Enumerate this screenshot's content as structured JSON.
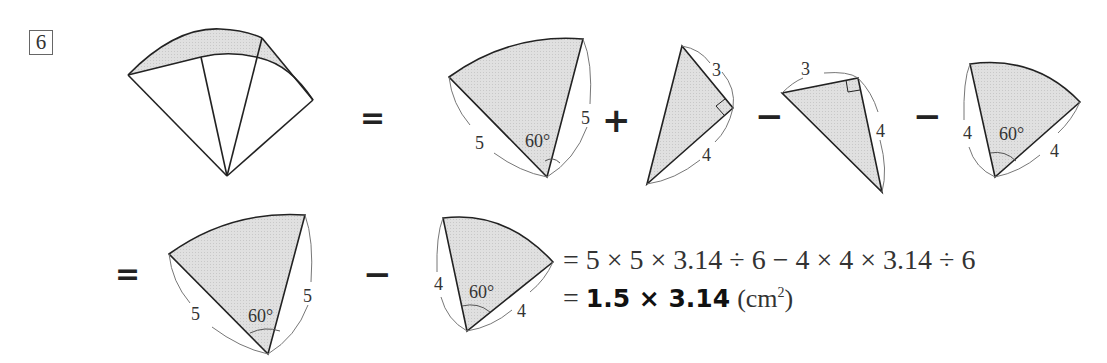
{
  "problem_number": "6",
  "operators": {
    "row1": [
      "=",
      "+",
      "−",
      "−"
    ],
    "row2": [
      "=",
      "−"
    ]
  },
  "figures": {
    "original": {
      "description": "combined sectors with shaded crescent band"
    },
    "sector_r5_top": {
      "radius_label": "5",
      "angle_label": "60°"
    },
    "triangle_top_a": {
      "leg_a_label": "3",
      "leg_b_label": "4",
      "right_angle": true
    },
    "triangle_top_b": {
      "leg_a_label": "3",
      "leg_b_label": "4",
      "right_angle": true
    },
    "sector_r4_top": {
      "radius_label": "4",
      "angle_label": "60°"
    },
    "sector_r5_bottom": {
      "radius_label": "5",
      "angle_label": "60°"
    },
    "sector_r4_bottom": {
      "radius_label": "4",
      "angle_label": "60°"
    }
  },
  "equation": {
    "line1": "= 5 × 5 × 3.14 ÷ 6 − 4 × 4 × 3.14 ÷ 6",
    "line2_prefix": "= ",
    "line2_answer": "1.5 × 3.14",
    "line2_unit": "(cm",
    "line2_unit_sup": "2",
    "line2_unit_close": ")"
  },
  "colors": {
    "shade": "#dcdcdc",
    "stroke": "#222222",
    "dim_line": "#777777"
  }
}
